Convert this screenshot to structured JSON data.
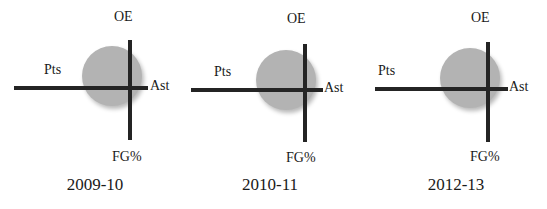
{
  "figure": {
    "background_color": "#ffffff",
    "disc_color": "#b3b3b3",
    "axis_color": "#242424"
  },
  "chart_data": {
    "type": "radar",
    "title": "",
    "subtitle": "",
    "xlabel": "",
    "ylabel": "",
    "grid": false,
    "legend": "none",
    "axes": [
      "OE",
      "Ast",
      "FG%",
      "Pts"
    ],
    "axis_order_note": "OE = up, Ast = right, FG% = down, Pts = left",
    "panel_labels": [
      "2009-10",
      "2010-11",
      "2012-13"
    ],
    "reference_circle": true,
    "series": [
      {
        "name": "2009-10",
        "values": [
          1.0,
          0.4,
          1.1,
          2.6
        ],
        "labels": {
          "OE": 1.0,
          "Ast": 0.4,
          "FG%": 1.1,
          "Pts": 2.6
        }
      },
      {
        "name": "2010-11",
        "values": [
          0.95,
          0.4,
          1.1,
          2.55
        ],
        "labels": {
          "OE": 0.95,
          "Ast": 0.4,
          "FG%": 1.1,
          "Pts": 2.55
        }
      },
      {
        "name": "2012-13",
        "values": [
          0.98,
          0.45,
          1.12,
          2.55
        ],
        "labels": {
          "OE": 0.98,
          "Ast": 0.45,
          "FG%": 1.12,
          "Pts": 2.55
        }
      }
    ]
  },
  "panels": [
    {
      "caption": "2009-10",
      "labels": {
        "oe": "OE",
        "ast": "Ast",
        "fg": "FG%",
        "pts": "Pts"
      }
    },
    {
      "caption": "2010-11",
      "labels": {
        "oe": "OE",
        "ast": "Ast",
        "fg": "FG%",
        "pts": "Pts"
      }
    },
    {
      "caption": "2012-13",
      "labels": {
        "oe": "OE",
        "ast": "Ast",
        "fg": "FG%",
        "pts": "Pts"
      }
    }
  ]
}
